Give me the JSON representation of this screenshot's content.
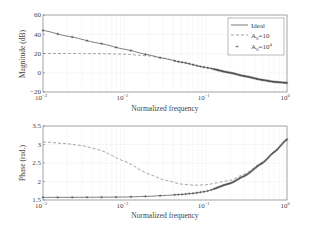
{
  "chart_data": [
    {
      "type": "line",
      "title": "",
      "xlabel": "Normalized frequency",
      "ylabel": "Magnitude (dB)",
      "xscale": "log",
      "xlim": [
        0.001,
        1
      ],
      "ylim": [
        -20,
        60
      ],
      "xticks": [
        "10^-3",
        "10^-2",
        "10^-1",
        "10^0"
      ],
      "yticks": [
        -20,
        0,
        20,
        40,
        60
      ],
      "grid": true,
      "legend_position": "upper right",
      "legend": [
        "Ideal",
        "A0=10",
        "A0=10^4"
      ],
      "x": [
        0.001,
        0.002,
        0.005,
        0.01,
        0.02,
        0.03,
        0.05,
        0.1,
        0.2,
        0.3,
        0.5,
        0.7,
        1.0
      ],
      "series": [
        {
          "name": "Ideal",
          "style": "solid",
          "values": [
            44,
            38,
            30.5,
            24.5,
            18.5,
            15,
            11,
            5.5,
            0,
            -3.5,
            -7.5,
            -9.5,
            -10.5
          ]
        },
        {
          "name": "A0=10",
          "style": "dashed",
          "values": [
            20,
            20,
            19.8,
            19.3,
            17.5,
            15.3,
            11.2,
            5.5,
            0,
            -3.5,
            -7.5,
            -9.5,
            -10.5
          ]
        },
        {
          "name": "A0=10^4",
          "style": "plus-markers",
          "values": [
            44,
            38,
            30.5,
            24.5,
            18.5,
            15,
            11,
            5.5,
            0,
            -3.5,
            -7.5,
            -9.5,
            -10.5
          ]
        }
      ]
    },
    {
      "type": "line",
      "title": "",
      "xlabel": "Normalized frequency",
      "ylabel": "Phase (rad.)",
      "xscale": "log",
      "xlim": [
        0.001,
        1
      ],
      "ylim": [
        1.5,
        3.5
      ],
      "xticks": [
        "10^-3",
        "10^-2",
        "10^-1",
        "10^0"
      ],
      "yticks": [
        1.5,
        2,
        2.5,
        3,
        3.5
      ],
      "grid": true,
      "x": [
        0.001,
        0.002,
        0.003,
        0.005,
        0.01,
        0.02,
        0.03,
        0.05,
        0.07,
        0.1,
        0.2,
        0.3,
        0.5,
        0.7,
        1.0
      ],
      "series": [
        {
          "name": "Ideal",
          "style": "solid",
          "values": [
            1.571,
            1.572,
            1.573,
            1.576,
            1.58,
            1.6,
            1.62,
            1.65,
            1.68,
            1.73,
            1.95,
            2.15,
            2.5,
            2.8,
            3.14
          ]
        },
        {
          "name": "A0=10",
          "style": "dashed",
          "values": [
            3.07,
            3.02,
            2.97,
            2.85,
            2.55,
            2.2,
            2.05,
            1.93,
            1.9,
            1.91,
            2.03,
            2.2,
            2.52,
            2.8,
            3.14
          ]
        },
        {
          "name": "A0=10^4",
          "style": "plus-markers",
          "values": [
            1.571,
            1.572,
            1.573,
            1.576,
            1.58,
            1.6,
            1.62,
            1.65,
            1.68,
            1.73,
            1.95,
            2.15,
            2.5,
            2.8,
            3.14
          ]
        }
      ]
    }
  ],
  "labels": {
    "top_ylabel": "Magnitude (dB)",
    "bottom_ylabel": "Phase (rad.)",
    "xlabel": "Normalized frequency",
    "legend_ideal": "Ideal",
    "legend_a10": "A",
    "legend_a10_sub": "0",
    "legend_a10_rest": "=10",
    "legend_a104": "A",
    "legend_a104_sub": "0",
    "legend_a104_rest": "=10",
    "legend_a104_sup": "4"
  },
  "ticks": {
    "top_y": [
      "60",
      "40",
      "20",
      "0",
      "−20"
    ],
    "bottom_y": [
      "3.5",
      "3",
      "2.5",
      "2",
      "1.5"
    ],
    "x_base": [
      "10",
      "10",
      "10",
      "10"
    ],
    "x_exp": [
      "−3",
      "−2",
      "−1",
      "0"
    ]
  },
  "colors": {
    "line": "#555555",
    "markers": "#444444",
    "grid": "#d8d8d8",
    "axes": "#666666"
  }
}
